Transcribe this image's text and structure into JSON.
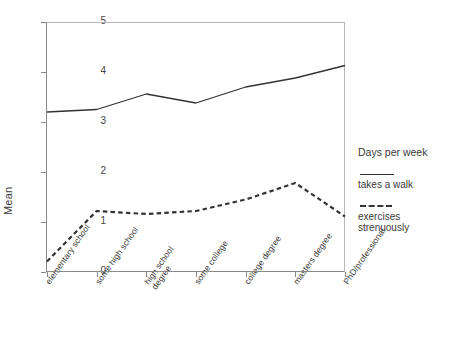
{
  "chart_data": {
    "type": "line",
    "title": "",
    "xlabel": "",
    "ylabel": "Mean",
    "ylim": [
      0,
      5
    ],
    "yticks": [
      0,
      1,
      2,
      3,
      4,
      5
    ],
    "grid": false,
    "legend_position": "right",
    "legend_title": "Days per week",
    "categories": [
      "elementary school",
      "some high school",
      "high school\ndegree",
      "some college",
      "college degree",
      "masters degree",
      "PhD/professional"
    ],
    "series": [
      {
        "name": "takes a walk",
        "style": "solid",
        "color": "#333333",
        "values": [
          3.2,
          3.25,
          3.56,
          3.38,
          3.7,
          3.88,
          4.13
        ]
      },
      {
        "name": "exercises\nstrenuously",
        "style": "dashed",
        "color": "#333333",
        "values": [
          0.21,
          1.22,
          1.16,
          1.22,
          1.45,
          1.78,
          1.11
        ]
      }
    ]
  },
  "axis": {
    "y_title": "Mean",
    "y_tick_labels": [
      "0",
      "1",
      "2",
      "3",
      "4",
      "5"
    ]
  },
  "legend": {
    "title": "Days per week",
    "entries": [
      {
        "label": "takes a walk",
        "style": "solid"
      },
      {
        "label": "exercises\nstrenuously",
        "style": "dashed"
      }
    ]
  }
}
